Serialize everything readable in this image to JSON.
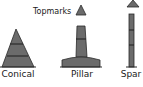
{
  "diagram": {
    "title_label": "Topmarks",
    "colors": {
      "fill": "#6b6b6b",
      "stroke": "#2a2a2a",
      "band": "#1e1e1e",
      "background": "#ffffff"
    },
    "shapes": [
      {
        "id": "conical",
        "label": "Conical",
        "type": "cone",
        "bands": 2
      },
      {
        "id": "pillar",
        "label": "Pillar",
        "type": "pillar",
        "bands": 1,
        "topmark": "triangle"
      },
      {
        "id": "spar",
        "label": "Spar",
        "type": "spar",
        "bands": 2,
        "topmark": "triangle"
      }
    ]
  }
}
